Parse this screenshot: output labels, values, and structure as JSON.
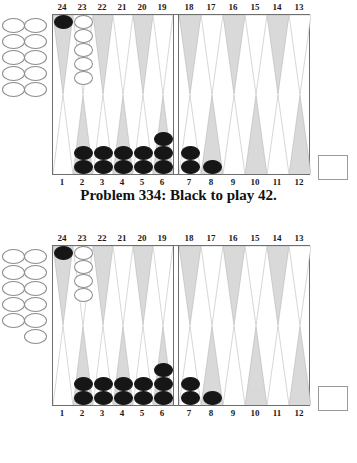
{
  "page": {
    "background_color": "#ffffff"
  },
  "colors": {
    "black_checker": "#161616",
    "white_checker": "#ffffff",
    "point_shaded": "#d9d9d9",
    "point_light": "#ffffff",
    "board_border": "#6e6e6e",
    "text": "#111111"
  },
  "labels": {
    "top": [
      "24",
      "23",
      "22",
      "21",
      "20",
      "19",
      "18",
      "17",
      "16",
      "15",
      "14",
      "13"
    ],
    "bottom": [
      "1",
      "2",
      "3",
      "4",
      "5",
      "6",
      "7",
      "8",
      "9",
      "10",
      "11",
      "12"
    ]
  },
  "figures": [
    {
      "id": "problem-334",
      "caption": "Problem 334:  Black to play 42.",
      "caption_visible": true,
      "offboard_white_count": 10,
      "bearoff_tray_count": 0,
      "points": [
        {
          "number": "24",
          "quad": "top",
          "shade": "shaded",
          "color": "black",
          "count": 1
        },
        {
          "number": "23",
          "quad": "top",
          "shade": "light",
          "color": "white",
          "count": 5
        },
        {
          "number": "22",
          "quad": "top",
          "shade": "shaded",
          "color": "none",
          "count": 0
        },
        {
          "number": "21",
          "quad": "top",
          "shade": "light",
          "color": "none",
          "count": 0
        },
        {
          "number": "20",
          "quad": "top",
          "shade": "shaded",
          "color": "none",
          "count": 0
        },
        {
          "number": "19",
          "quad": "top",
          "shade": "light",
          "color": "none",
          "count": 0
        },
        {
          "number": "18",
          "quad": "top",
          "shade": "shaded",
          "color": "none",
          "count": 0
        },
        {
          "number": "17",
          "quad": "top",
          "shade": "light",
          "color": "none",
          "count": 0
        },
        {
          "number": "16",
          "quad": "top",
          "shade": "shaded",
          "color": "none",
          "count": 0
        },
        {
          "number": "15",
          "quad": "top",
          "shade": "light",
          "color": "none",
          "count": 0
        },
        {
          "number": "14",
          "quad": "top",
          "shade": "shaded",
          "color": "none",
          "count": 0
        },
        {
          "number": "13",
          "quad": "top",
          "shade": "light",
          "color": "none",
          "count": 0
        },
        {
          "number": "1",
          "quad": "bottom",
          "shade": "light",
          "color": "none",
          "count": 0
        },
        {
          "number": "2",
          "quad": "bottom",
          "shade": "shaded",
          "color": "black",
          "count": 2
        },
        {
          "number": "3",
          "quad": "bottom",
          "shade": "light",
          "color": "black",
          "count": 2
        },
        {
          "number": "4",
          "quad": "bottom",
          "shade": "shaded",
          "color": "black",
          "count": 2
        },
        {
          "number": "5",
          "quad": "bottom",
          "shade": "light",
          "color": "black",
          "count": 2
        },
        {
          "number": "6",
          "quad": "bottom",
          "shade": "shaded",
          "color": "black",
          "count": 3
        },
        {
          "number": "7",
          "quad": "bottom",
          "shade": "light",
          "color": "black",
          "count": 2
        },
        {
          "number": "8",
          "quad": "bottom",
          "shade": "shaded",
          "color": "black",
          "count": 1
        },
        {
          "number": "9",
          "quad": "bottom",
          "shade": "light",
          "color": "none",
          "count": 0
        },
        {
          "number": "10",
          "quad": "bottom",
          "shade": "shaded",
          "color": "none",
          "count": 0
        },
        {
          "number": "11",
          "quad": "bottom",
          "shade": "light",
          "color": "none",
          "count": 0
        },
        {
          "number": "12",
          "quad": "bottom",
          "shade": "shaded",
          "color": "none",
          "count": 0
        }
      ]
    },
    {
      "id": "problem-335",
      "caption": "",
      "caption_visible": false,
      "offboard_white_count": 11,
      "bearoff_tray_count": 0,
      "points": [
        {
          "number": "24",
          "quad": "top",
          "shade": "shaded",
          "color": "black",
          "count": 1
        },
        {
          "number": "23",
          "quad": "top",
          "shade": "light",
          "color": "white",
          "count": 4
        },
        {
          "number": "22",
          "quad": "top",
          "shade": "shaded",
          "color": "none",
          "count": 0
        },
        {
          "number": "21",
          "quad": "top",
          "shade": "light",
          "color": "none",
          "count": 0
        },
        {
          "number": "20",
          "quad": "top",
          "shade": "shaded",
          "color": "none",
          "count": 0
        },
        {
          "number": "19",
          "quad": "top",
          "shade": "light",
          "color": "none",
          "count": 0
        },
        {
          "number": "18",
          "quad": "top",
          "shade": "shaded",
          "color": "none",
          "count": 0
        },
        {
          "number": "17",
          "quad": "top",
          "shade": "light",
          "color": "none",
          "count": 0
        },
        {
          "number": "16",
          "quad": "top",
          "shade": "shaded",
          "color": "none",
          "count": 0
        },
        {
          "number": "15",
          "quad": "top",
          "shade": "light",
          "color": "none",
          "count": 0
        },
        {
          "number": "14",
          "quad": "top",
          "shade": "shaded",
          "color": "none",
          "count": 0
        },
        {
          "number": "13",
          "quad": "top",
          "shade": "light",
          "color": "none",
          "count": 0
        },
        {
          "number": "1",
          "quad": "bottom",
          "shade": "light",
          "color": "none",
          "count": 0
        },
        {
          "number": "2",
          "quad": "bottom",
          "shade": "shaded",
          "color": "black",
          "count": 2
        },
        {
          "number": "3",
          "quad": "bottom",
          "shade": "light",
          "color": "black",
          "count": 2
        },
        {
          "number": "4",
          "quad": "bottom",
          "shade": "shaded",
          "color": "black",
          "count": 2
        },
        {
          "number": "5",
          "quad": "bottom",
          "shade": "light",
          "color": "black",
          "count": 2
        },
        {
          "number": "6",
          "quad": "bottom",
          "shade": "shaded",
          "color": "black",
          "count": 3
        },
        {
          "number": "7",
          "quad": "bottom",
          "shade": "light",
          "color": "black",
          "count": 2
        },
        {
          "number": "8",
          "quad": "bottom",
          "shade": "shaded",
          "color": "black",
          "count": 1
        },
        {
          "number": "9",
          "quad": "bottom",
          "shade": "light",
          "color": "none",
          "count": 0
        },
        {
          "number": "10",
          "quad": "bottom",
          "shade": "shaded",
          "color": "none",
          "count": 0
        },
        {
          "number": "11",
          "quad": "bottom",
          "shade": "light",
          "color": "none",
          "count": 0
        },
        {
          "number": "12",
          "quad": "bottom",
          "shade": "shaded",
          "color": "none",
          "count": 0
        }
      ]
    }
  ]
}
